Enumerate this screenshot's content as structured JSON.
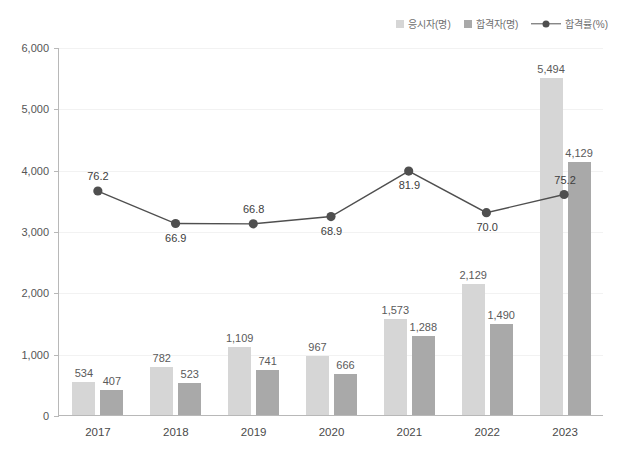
{
  "legend": {
    "items": [
      {
        "label": "응시자(명)",
        "type": "swatch",
        "color": "#d6d6d6",
        "icon": "square-swatch-icon"
      },
      {
        "label": "합격자(명)",
        "type": "swatch",
        "color": "#a9a9a9",
        "icon": "square-swatch-icon"
      },
      {
        "label": "합격률(%)",
        "type": "line",
        "color": "#4f4f4f",
        "icon": "line-marker-icon"
      }
    ]
  },
  "chart_data": {
    "type": "bar",
    "title": "",
    "subtitle": "",
    "xlabel": "",
    "ylabel": "",
    "ylim": [
      0,
      6000
    ],
    "yticks": [
      0,
      1000,
      2000,
      3000,
      4000,
      5000,
      6000
    ],
    "ytick_labels": [
      "0",
      "1,000",
      "2,000",
      "3,000",
      "4,000",
      "5,000",
      "6,000"
    ],
    "grid": true,
    "legend_position": "top-right",
    "categories": [
      "2017",
      "2018",
      "2019",
      "2020",
      "2021",
      "2022",
      "2023"
    ],
    "series": [
      {
        "name": "응시자(명)",
        "type": "bar",
        "color": "#d6d6d6",
        "values": [
          534,
          782,
          1109,
          967,
          1573,
          2129,
          5494
        ],
        "labels": [
          "534",
          "782",
          "1,109",
          "967",
          "1,573",
          "2,129",
          "5,494"
        ]
      },
      {
        "name": "합격자(명)",
        "type": "bar",
        "color": "#a9a9a9",
        "values": [
          407,
          523,
          741,
          666,
          1288,
          1490,
          4129
        ],
        "labels": [
          "407",
          "523",
          "741",
          "666",
          "1,288",
          "1,490",
          "4,129"
        ]
      },
      {
        "name": "합격률(%)",
        "type": "line",
        "color": "#4f4f4f",
        "axis": "secondary",
        "values": [
          76.2,
          66.9,
          66.8,
          68.9,
          81.9,
          70.0,
          75.2
        ],
        "labels": [
          "76.2",
          "66.9",
          "66.8",
          "68.9",
          "81.9",
          "70.0",
          "75.2"
        ],
        "label_positions": [
          "above",
          "below",
          "above",
          "below",
          "below",
          "below",
          "above"
        ]
      }
    ]
  },
  "colors": {
    "series_a": "#d6d6d6",
    "series_b": "#a9a9a9",
    "line": "#4f4f4f",
    "axis": "#b8b8b8",
    "grid": "#f2f2f2",
    "text": "#4a4a4a",
    "background": "#ffffff"
  }
}
